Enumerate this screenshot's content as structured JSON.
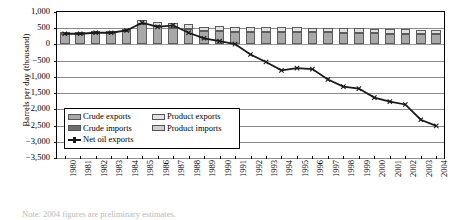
{
  "chart_data": {
    "type": "bar",
    "title": "",
    "xlabel": "",
    "ylabel": "Barrels per day (thousand)",
    "ylim": [
      -3500,
      1000
    ],
    "ytick_step": 500,
    "ytick_labels": [
      "1,000",
      "500",
      "0",
      "−500",
      "−1,000",
      "−1,500",
      "−2,000",
      "−2,500",
      "−3,000",
      "−3,500"
    ],
    "ytick_values": [
      1000,
      500,
      0,
      -500,
      -1000,
      -1500,
      -2000,
      -2500,
      -3000,
      -3500
    ],
    "grid": true,
    "stacked": true,
    "legend_position": "inside-lower-left",
    "categories": [
      "1980",
      "1981",
      "1982",
      "1983",
      "1984",
      "1985",
      "1986",
      "1987",
      "1988",
      "1989",
      "1990",
      "1991",
      "1992",
      "1993",
      "1994",
      "1995",
      "1996",
      "1997",
      "1998",
      "1999",
      "2000",
      "2001",
      "2002",
      "2003",
      "2004"
    ],
    "series": [
      {
        "name": "Crude exports",
        "color": "#a8a8a8",
        "values": [
          330,
          330,
          340,
          340,
          400,
          620,
          560,
          520,
          480,
          400,
          400,
          390,
          390,
          390,
          380,
          380,
          370,
          370,
          360,
          350,
          340,
          330,
          330,
          320,
          320
        ]
      },
      {
        "name": "Product exports",
        "color": "#e0e0e0",
        "values": [
          60,
          60,
          70,
          70,
          90,
          130,
          130,
          150,
          150,
          150,
          160,
          150,
          150,
          150,
          150,
          150,
          150,
          150,
          150,
          150,
          140,
          140,
          140,
          130,
          130
        ]
      },
      {
        "name": "Crude imports",
        "color": "#6f6f6f",
        "values": [
          -60,
          -40,
          -30,
          -30,
          -40,
          -50,
          -110,
          -110,
          -200,
          -260,
          -320,
          -330,
          -470,
          -640,
          -880,
          -830,
          -840,
          -1140,
          -1250,
          -1280,
          -1500,
          -1590,
          -1640,
          -2050,
          -2200
        ]
      },
      {
        "name": "Product imports",
        "color": "#cfcfcf",
        "values": [
          -20,
          -20,
          -20,
          -20,
          -20,
          -30,
          -40,
          -50,
          -70,
          -100,
          -140,
          -200,
          -380,
          -440,
          -450,
          -430,
          -440,
          -460,
          -560,
          -580,
          -620,
          -640,
          -680,
          -720,
          -760
        ]
      },
      {
        "name": "Net oil exports",
        "color": "#1a1a1a",
        "type": "line",
        "values": [
          330,
          330,
          360,
          360,
          430,
          670,
          540,
          590,
          360,
          190,
          100,
          10,
          -310,
          -540,
          -800,
          -730,
          -760,
          -1080,
          -1300,
          -1360,
          -1640,
          -1760,
          -1850,
          -2320,
          -2510
        ]
      }
    ]
  },
  "legend": {
    "entries": [
      {
        "label": "Crude exports",
        "kind": "box",
        "swatch": "sw-crude-exp"
      },
      {
        "label": "Product exports",
        "kind": "box",
        "swatch": "sw-prod-exp"
      },
      {
        "label": "Crude imports",
        "kind": "box",
        "swatch": "sw-crude-imp"
      },
      {
        "label": "Product imports",
        "kind": "box",
        "swatch": "sw-prod-imp"
      },
      {
        "label": "Net oil exports",
        "kind": "line",
        "swatch": "swline"
      }
    ]
  },
  "note": {
    "text": "Note: 2004 figures are preliminary estimates."
  }
}
